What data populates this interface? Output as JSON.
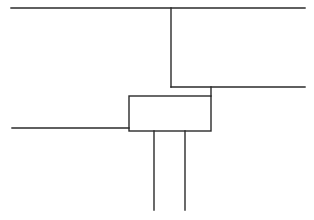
{
  "diagram": {
    "type": "line-schematic",
    "stroke_color": "#2a2a2a",
    "background_color": "#ffffff",
    "labels": []
  }
}
